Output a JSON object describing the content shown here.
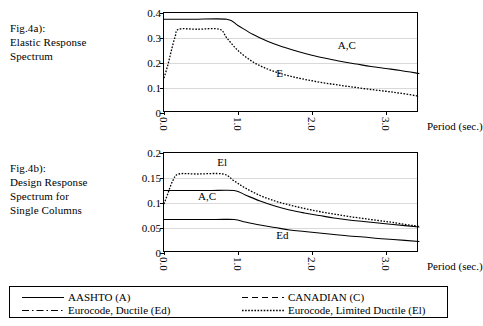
{
  "figure_a": {
    "caption_lines": [
      "Fig.4a):",
      "Elastic Response",
      "Spectrum"
    ]
  },
  "figure_b": {
    "caption_lines": [
      "Fig.4b):",
      "Design Response",
      "Spectrum for",
      "Single Columns"
    ]
  },
  "axis": {
    "xlabel": "Period (sec.)",
    "xticks": [
      "0.0",
      "1.0",
      "2.0",
      "3.0"
    ]
  },
  "legend": {
    "entries": [
      {
        "label": "AASHTO (A)",
        "style": "solid"
      },
      {
        "label": "CANADIAN (C)",
        "style": "dashed"
      },
      {
        "label": "Eurocode, Ductile (Ed)",
        "style": "dash-dot"
      },
      {
        "label": "Eurocode, Limited Ductile (El)",
        "style": "dotted"
      }
    ]
  },
  "chart_data": [
    {
      "type": "line",
      "id": "fig4a",
      "title": "Fig.4a): Elastic Response Spectrum",
      "xlabel": "Period (sec.)",
      "ylabel": "",
      "xlim": [
        0,
        3.45
      ],
      "ylim": [
        0,
        0.4
      ],
      "xticks": [
        0.0,
        1.0,
        2.0,
        3.0
      ],
      "yticks": [
        0,
        0.1,
        0.2,
        0.3,
        0.4
      ],
      "ytick_labels": [
        "0",
        "0.1",
        "0.2",
        "0.3",
        "0.4"
      ],
      "grid": "horizontal",
      "legend_position": "below-figure",
      "annotations": [
        {
          "text": "A,C",
          "x": 2.35,
          "y": 0.268
        },
        {
          "text": "E",
          "x": 1.52,
          "y": 0.155
        }
      ],
      "series": [
        {
          "name": "A,C",
          "label": "AASHTO (A) / CANADIAN (C)",
          "style": "solid",
          "x": [
            0.0,
            0.1,
            0.4,
            0.85,
            1.0,
            1.2,
            1.4,
            1.6,
            1.8,
            2.0,
            2.2,
            2.4,
            2.6,
            2.8,
            3.0,
            3.2,
            3.45
          ],
          "y": [
            0.375,
            0.375,
            0.375,
            0.375,
            0.35,
            0.315,
            0.287,
            0.265,
            0.247,
            0.231,
            0.218,
            0.206,
            0.196,
            0.186,
            0.178,
            0.17,
            0.158
          ]
        },
        {
          "name": "E",
          "label": "Eurocode (E)",
          "style": "dotted",
          "x": [
            0.0,
            0.05,
            0.1,
            0.15,
            0.2,
            0.45,
            0.75,
            0.85,
            1.0,
            1.2,
            1.4,
            1.6,
            1.8,
            2.0,
            2.2,
            2.4,
            2.6,
            2.8,
            3.0,
            3.2,
            3.45
          ],
          "y": [
            0.14,
            0.19,
            0.25,
            0.305,
            0.335,
            0.335,
            0.335,
            0.3,
            0.25,
            0.205,
            0.176,
            0.156,
            0.141,
            0.129,
            0.119,
            0.11,
            0.102,
            0.094,
            0.087,
            0.079,
            0.067
          ]
        }
      ]
    },
    {
      "type": "line",
      "id": "fig4b",
      "title": "Fig.4b): Design Response Spectrum for Single Columns",
      "xlabel": "Period (sec.)",
      "ylabel": "",
      "xlim": [
        0,
        3.45
      ],
      "ylim": [
        0,
        0.2
      ],
      "xticks": [
        0.0,
        1.0,
        2.0,
        3.0
      ],
      "yticks": [
        0,
        0.05,
        0.1,
        0.15,
        0.2
      ],
      "ytick_labels": [
        "0",
        "0.05",
        "0.1",
        "0.15",
        "0.2"
      ],
      "grid": "horizontal",
      "legend_position": "below-figure",
      "annotations": [
        {
          "text": "El",
          "x": 0.72,
          "y": 0.18
        },
        {
          "text": "A,C",
          "x": 0.46,
          "y": 0.112
        },
        {
          "text": "Ed",
          "x": 1.52,
          "y": 0.035
        }
      ],
      "series": [
        {
          "name": "A,C",
          "label": "AASHTO (A) / CANADIAN (C)",
          "style": "solid",
          "x": [
            0.0,
            0.2,
            0.6,
            0.95,
            1.1,
            1.3,
            1.5,
            1.7,
            1.9,
            2.1,
            2.3,
            2.5,
            2.7,
            2.9,
            3.1,
            3.45
          ],
          "y": [
            0.125,
            0.125,
            0.125,
            0.125,
            0.116,
            0.104,
            0.094,
            0.086,
            0.08,
            0.075,
            0.07,
            0.066,
            0.063,
            0.06,
            0.057,
            0.052
          ]
        },
        {
          "name": "El",
          "label": "Eurocode, Limited Ductile (El)",
          "style": "dotted",
          "x": [
            0.0,
            0.05,
            0.12,
            0.2,
            0.45,
            0.8,
            0.95,
            1.1,
            1.3,
            1.5,
            1.7,
            1.9,
            2.1,
            2.3,
            2.5,
            2.7,
            2.9,
            3.1,
            3.45
          ],
          "y": [
            0.098,
            0.118,
            0.145,
            0.158,
            0.158,
            0.158,
            0.144,
            0.13,
            0.115,
            0.104,
            0.096,
            0.089,
            0.083,
            0.078,
            0.073,
            0.069,
            0.065,
            0.061,
            0.053
          ]
        },
        {
          "name": "Ed",
          "label": "Eurocode, Ductile (Ed)",
          "style": "solid",
          "x": [
            0.0,
            0.3,
            0.7,
            0.95,
            1.1,
            1.3,
            1.5,
            1.7,
            1.9,
            2.1,
            2.3,
            2.5,
            2.7,
            2.9,
            3.1,
            3.45
          ],
          "y": [
            0.067,
            0.067,
            0.067,
            0.067,
            0.062,
            0.056,
            0.051,
            0.046,
            0.043,
            0.04,
            0.037,
            0.034,
            0.032,
            0.029,
            0.027,
            0.023
          ]
        }
      ]
    }
  ]
}
